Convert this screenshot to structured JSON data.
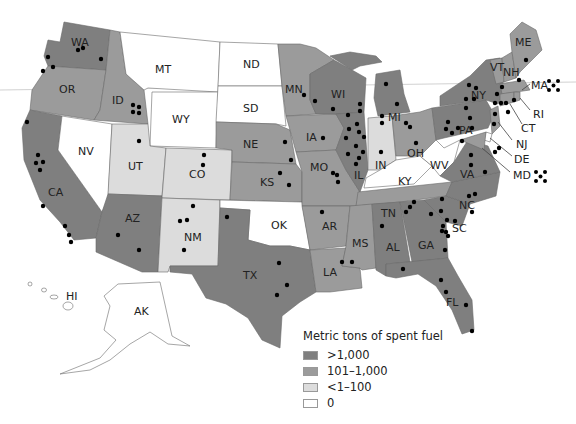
{
  "legend": {
    "title": "Metric tons of spent fuel",
    "categories": [
      {
        "label": ">1,000",
        "color": "#7f7f7f"
      },
      {
        "label": "101–1,000",
        "color": "#9b9b9b"
      },
      {
        "label": "<1–100",
        "color": "#dcdcdc"
      },
      {
        "label": "0",
        "color": "#ffffff"
      }
    ]
  },
  "states": {
    "WA": "WA",
    "OR": "OR",
    "CA": "CA",
    "ID": "ID",
    "NV": "NV",
    "MT": "MT",
    "WY": "WY",
    "UT": "UT",
    "AZ": "AZ",
    "CO": "CO",
    "NM": "NM",
    "ND": "ND",
    "SD": "SD",
    "NE": "NE",
    "KS": "KS",
    "OK": "OK",
    "TX": "TX",
    "MN": "MN",
    "IA": "IA",
    "MO": "MO",
    "AR": "AR",
    "LA": "LA",
    "WI": "WI",
    "IL": "IL",
    "MI": "MI",
    "IN": "IN",
    "OH": "OH",
    "KY": "KY",
    "TN": "TN",
    "MS": "MS",
    "AL": "AL",
    "GA": "GA",
    "FL": "FL",
    "SC": "SC",
    "NC": "NC",
    "VA": "VA",
    "WV": "WV",
    "PA": "PA",
    "NY": "NY",
    "VT": "VT",
    "NH": "NH",
    "ME": "ME",
    "MA": "MA",
    "RI": "RI",
    "CT": "CT",
    "NJ": "NJ",
    "DE": "DE",
    "MD": "MD",
    "HI": "HI",
    "AK": "AK"
  }
}
